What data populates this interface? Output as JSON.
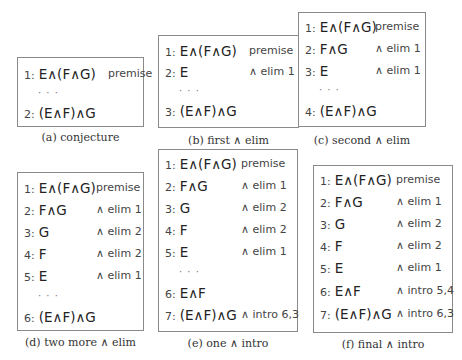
{
  "panels": [
    {
      "id": "a",
      "caption": "(a) conjecture",
      "box": {
        "left": 17,
        "top": 57,
        "width": 127,
        "height": 70
      },
      "caption_pos": {
        "left": 17,
        "top": 131,
        "width": 127
      },
      "just_x": 90,
      "lines": [
        {
          "num": "1:",
          "formula": "E∧(F∧G)",
          "just": "premise",
          "top": 8
        },
        {
          "dots": "· · ·",
          "top": 27
        },
        {
          "num": "2:",
          "formula": "(E∧F)∧G",
          "just": "",
          "top": 47
        }
      ]
    },
    {
      "id": "b",
      "caption": "(b) first ∧ elim",
      "box": {
        "left": 158,
        "top": 35,
        "width": 141,
        "height": 93
      },
      "caption_pos": {
        "left": 158,
        "top": 134,
        "width": 141
      },
      "just_x": 90,
      "lines": [
        {
          "num": "1:",
          "formula": "E∧(F∧G)",
          "just": "premise",
          "top": 7
        },
        {
          "num": "2:",
          "formula": "E",
          "just": "∧ elim 1",
          "top": 28
        },
        {
          "dots": "· · ·",
          "top": 47
        },
        {
          "num": "3:",
          "formula": "(E∧F)∧G",
          "just": "",
          "top": 67
        }
      ]
    },
    {
      "id": "c",
      "caption": "(c) second ∧ elim",
      "box": {
        "left": 298,
        "top": 12,
        "width": 128,
        "height": 115
      },
      "caption_pos": {
        "left": 298,
        "top": 134,
        "width": 128
      },
      "just_x": 76,
      "lines": [
        {
          "num": "1:",
          "formula": "E∧(F∧G)",
          "just": "premise",
          "top": 6
        },
        {
          "num": "2:",
          "formula": "F∧G",
          "just": "∧ elim 1",
          "top": 28
        },
        {
          "num": "3:",
          "formula": "E",
          "just": "∧ elim 1",
          "top": 50
        },
        {
          "dots": "· · ·",
          "top": 69
        },
        {
          "num": "4:",
          "formula": "(E∧F)∧G",
          "just": "",
          "top": 90
        }
      ]
    },
    {
      "id": "d",
      "caption": "(d) two more ∧ elim",
      "box": {
        "left": 17,
        "top": 172,
        "width": 127,
        "height": 159
      },
      "caption_pos": {
        "left": 17,
        "top": 336,
        "width": 127
      },
      "just_x": 78,
      "lines": [
        {
          "num": "1:",
          "formula": "E∧(F∧G)",
          "just": "premise",
          "top": 7
        },
        {
          "num": "2:",
          "formula": "F∧G",
          "just": "∧ elim 1",
          "top": 29
        },
        {
          "num": "3:",
          "formula": "G",
          "just": "∧ elim 2",
          "top": 51
        },
        {
          "num": "4:",
          "formula": "F",
          "just": "∧ elim 2",
          "top": 73
        },
        {
          "num": "5:",
          "formula": "E",
          "just": "∧ elim 1",
          "top": 95
        },
        {
          "dots": "· · ·",
          "top": 115
        },
        {
          "num": "6:",
          "formula": "(E∧F)∧G",
          "just": "",
          "top": 136
        }
      ]
    },
    {
      "id": "e",
      "caption": "(e) one ∧ intro",
      "box": {
        "left": 158,
        "top": 149,
        "width": 140,
        "height": 183
      },
      "caption_pos": {
        "left": 158,
        "top": 337,
        "width": 140
      },
      "just_x": 82,
      "lines": [
        {
          "num": "1:",
          "formula": "E∧(F∧G)",
          "just": "premise",
          "top": 6
        },
        {
          "num": "2:",
          "formula": "F∧G",
          "just": "∧ elim 1",
          "top": 28
        },
        {
          "num": "3:",
          "formula": "G",
          "just": "∧ elim 2",
          "top": 50
        },
        {
          "num": "4:",
          "formula": "F",
          "just": "∧ elim 2",
          "top": 72
        },
        {
          "num": "5:",
          "formula": "E",
          "just": "∧ elim 1",
          "top": 94
        },
        {
          "dots": "· · ·",
          "top": 114
        },
        {
          "num": "6:",
          "formula": "E∧F",
          "just": "",
          "top": 135
        },
        {
          "num": "7:",
          "formula": "(E∧F)∧G",
          "just": "∧ intro 6,3",
          "top": 157
        }
      ]
    },
    {
      "id": "f",
      "caption": "(f) final ∧ intro",
      "box": {
        "left": 313,
        "top": 165,
        "width": 140,
        "height": 168
      },
      "caption_pos": {
        "left": 313,
        "top": 338,
        "width": 140
      },
      "just_x": 82,
      "lines": [
        {
          "num": "1:",
          "formula": "E∧(F∧G)",
          "just": "premise",
          "top": 6
        },
        {
          "num": "2:",
          "formula": "F∧G",
          "just": "∧ elim 1",
          "top": 28
        },
        {
          "num": "3:",
          "formula": "G",
          "just": "∧ elim 2",
          "top": 50
        },
        {
          "num": "4:",
          "formula": "F",
          "just": "∧ elim 2",
          "top": 72
        },
        {
          "num": "5:",
          "formula": "E",
          "just": "∧ elim 1",
          "top": 94
        },
        {
          "num": "6:",
          "formula": "E∧F",
          "just": "∧ intro 5,4",
          "top": 117
        },
        {
          "num": "7:",
          "formula": "(E∧F)∧G",
          "just": "∧ intro 6,3",
          "top": 140
        }
      ]
    }
  ]
}
